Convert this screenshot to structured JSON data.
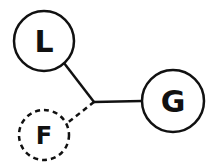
{
  "diagram": {
    "nodes": [
      {
        "id": "L",
        "label": "L",
        "style": "solid",
        "cx": 44,
        "cy": 41,
        "r": 30
      },
      {
        "id": "G",
        "label": "G",
        "style": "solid",
        "cx": 173,
        "cy": 101,
        "r": 31
      },
      {
        "id": "F",
        "label": "F",
        "style": "dashed",
        "cx": 44,
        "cy": 135,
        "r": 25
      }
    ],
    "junction": {
      "x": 94,
      "y": 102
    },
    "edges": [
      {
        "from": "L",
        "to": "junction",
        "style": "solid"
      },
      {
        "from": "junction",
        "to": "G",
        "style": "solid"
      },
      {
        "from": "junction",
        "to": "F",
        "style": "dashed"
      }
    ],
    "stroke_color": "#111111"
  }
}
